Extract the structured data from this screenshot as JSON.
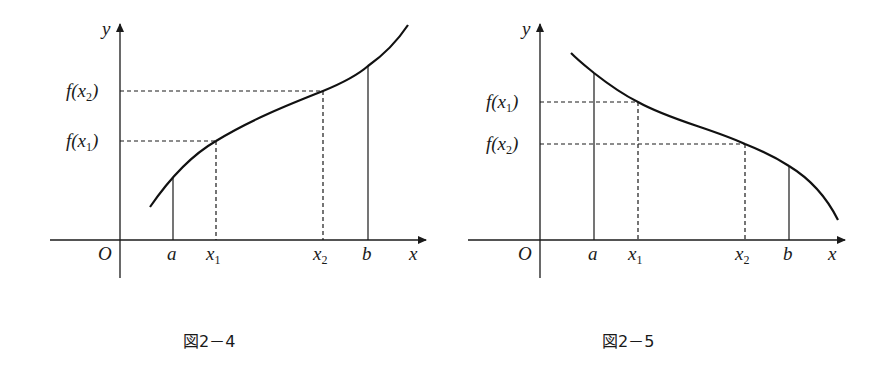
{
  "figures": [
    {
      "id": "fig-2-4",
      "caption": "図2－4",
      "description": "Increasing function on [a, b]; x1 < x2 implies f(x1) < f(x2)",
      "axis_labels": {
        "x": "x",
        "y": "y",
        "origin": "O"
      },
      "x_ticks": [
        {
          "name": "a",
          "sub": ""
        },
        {
          "name": "x",
          "sub": "1"
        },
        {
          "name": "x",
          "sub": "2"
        },
        {
          "name": "b",
          "sub": ""
        }
      ],
      "y_ticks": [
        {
          "prefix": "f(x",
          "sub": "2",
          "suffix": ")"
        },
        {
          "prefix": "f(x",
          "sub": "1",
          "suffix": ")"
        }
      ]
    },
    {
      "id": "fig-2-5",
      "caption": "図2－5",
      "description": "Decreasing function on [a, b]; x1 < x2 implies f(x1) > f(x2)",
      "axis_labels": {
        "x": "x",
        "y": "y",
        "origin": "O"
      },
      "x_ticks": [
        {
          "name": "a",
          "sub": ""
        },
        {
          "name": "x",
          "sub": "1"
        },
        {
          "name": "x",
          "sub": "2"
        },
        {
          "name": "b",
          "sub": ""
        }
      ],
      "y_ticks": [
        {
          "prefix": "f(x",
          "sub": "1",
          "suffix": ")"
        },
        {
          "prefix": "f(x",
          "sub": "2",
          "suffix": ")"
        }
      ]
    }
  ],
  "colors": {
    "ink": "#1a1a1a",
    "background": "#ffffff"
  }
}
